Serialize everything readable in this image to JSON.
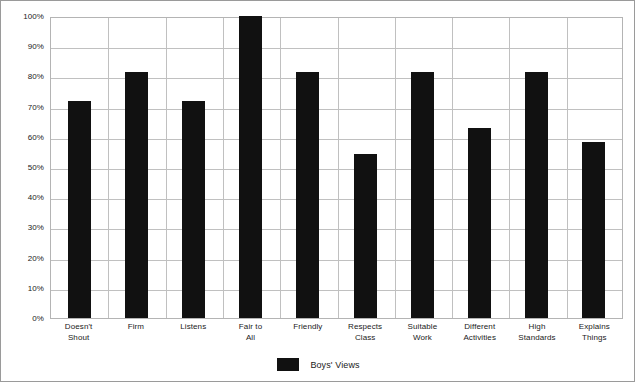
{
  "chart_data": {
    "type": "bar",
    "title": "",
    "subtitle": "",
    "xlabel": "",
    "ylabel": "",
    "categories": [
      "Doesn't Shout",
      "Firm",
      "Listens",
      "Fair to All",
      "Friendly",
      "Respects Class",
      "Suitable Work",
      "Different Activities",
      "High Standards",
      "Explains Things"
    ],
    "category_lines": [
      [
        "Doesn't",
        "Shout"
      ],
      [
        "Firm"
      ],
      [
        "Listens"
      ],
      [
        "Fair to",
        "All"
      ],
      [
        "Friendly"
      ],
      [
        "Respects",
        "Class"
      ],
      [
        "Suitable",
        "Work"
      ],
      [
        "Different",
        "Activities"
      ],
      [
        "High",
        "Standards"
      ],
      [
        "Explains",
        "Things"
      ]
    ],
    "series": [
      {
        "name": "Boys' Views",
        "color": "#111111",
        "values": [
          72,
          81.5,
          72,
          100,
          81.5,
          54.3,
          81.5,
          63,
          81.5,
          58.3
        ]
      }
    ],
    "ylim": [
      0,
      100
    ],
    "y_ticks": [
      0,
      10,
      20,
      30,
      40,
      50,
      60,
      70,
      80,
      90,
      100
    ],
    "y_tick_labels": [
      "0%",
      "10%",
      "20%",
      "30%",
      "40%",
      "50%",
      "60%",
      "70%",
      "80%",
      "90%",
      "100%"
    ],
    "grid": true,
    "grid_orientation": "both",
    "legend_position": "bottom-center",
    "legend_entries": [
      "Boys' Views"
    ],
    "colors": {
      "bar": "#111111",
      "gridline": "#c0c0c0",
      "plot_border": "#b4b4b4",
      "figure_border": "#9a9a9a",
      "background": "#ffffff",
      "text": "#1a1a1a"
    }
  }
}
